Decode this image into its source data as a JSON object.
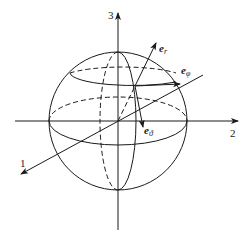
{
  "diagram": {
    "axes": [
      {
        "id": "axis-1",
        "label": "1"
      },
      {
        "id": "axis-2",
        "label": "2"
      },
      {
        "id": "axis-3",
        "label": "3"
      }
    ],
    "vectors": [
      {
        "id": "e_r",
        "base": "e",
        "sub": "r"
      },
      {
        "id": "e_phi",
        "base": "e",
        "sub": "φ"
      },
      {
        "id": "e_theta",
        "base": "e",
        "sub": "ϑ"
      }
    ],
    "colors": {
      "stroke": "#1a1a1a",
      "background": "#ffffff"
    }
  }
}
